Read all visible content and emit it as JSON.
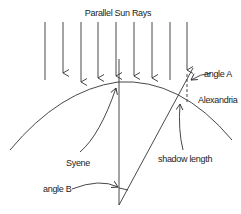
{
  "diagram": {
    "title": "Parallel Sun Rays",
    "labels": {
      "angle_a": "angle A",
      "alexandria": "Alexandria",
      "syene": "Syene",
      "shadow_length": "shadow length",
      "angle_b": "angle B"
    },
    "ray_count": 9,
    "colors": {
      "line": "#333333",
      "text": "#222222",
      "background": "#ffffff"
    }
  }
}
